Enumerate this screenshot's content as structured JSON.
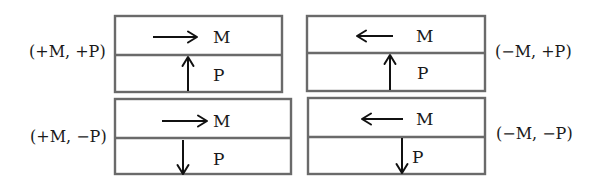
{
  "diagram": {
    "colors": {
      "frame": "#6a6a6a",
      "arrow": "#111111",
      "text": "#1a1a1a",
      "background": "#ffffff"
    },
    "states": [
      {
        "id": "pos-m-pos-p",
        "label": "(+M, +P)",
        "label_side": "left",
        "top_layer": {
          "label": "M",
          "arrow": "right"
        },
        "bottom_layer": {
          "label": "P",
          "arrow": "up"
        }
      },
      {
        "id": "neg-m-pos-p",
        "label": "(−M, +P)",
        "label_side": "right",
        "top_layer": {
          "label": "M",
          "arrow": "left"
        },
        "bottom_layer": {
          "label": "P",
          "arrow": "up"
        }
      },
      {
        "id": "pos-m-neg-p",
        "label": "(+M, −P)",
        "label_side": "left",
        "top_layer": {
          "label": "M",
          "arrow": "right"
        },
        "bottom_layer": {
          "label": "P",
          "arrow": "down"
        }
      },
      {
        "id": "neg-m-neg-p",
        "label": "(−M, −P)",
        "label_side": "right",
        "top_layer": {
          "label": "M",
          "arrow": "left"
        },
        "bottom_layer": {
          "label": "P",
          "arrow": "down"
        }
      }
    ]
  }
}
